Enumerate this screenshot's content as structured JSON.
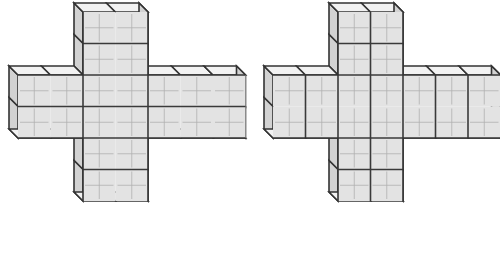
{
  "canvas": {
    "width": 500,
    "height": 262,
    "background": "#ffffff",
    "description": "Two cross (plus) shaped three-dimensional block figures drawn side by side in oblique projection"
  },
  "style": {
    "face_fill": "#e3e3e3",
    "side_fill": "#d2d2d2",
    "bottom_fill": "#f2f2f2",
    "outline_color": "#333333",
    "heavy_line_color": "#3a3a3a",
    "light_line_color": "#b0b0b0",
    "outline_width": 1.6,
    "heavy_line_width": 1.6,
    "light_line_width": 0.8,
    "depth_x": -9,
    "depth_y": -9
  },
  "figures": [
    {
      "id": "left-figure",
      "label": "Left cross figure",
      "origin_x": 18,
      "origin_y": 12,
      "cell_w": 32.5,
      "cell_h": 31.5,
      "arm_cols": 7,
      "arm_rows": 6,
      "center_col_start": 2,
      "center_col_span": 2,
      "center_row_start": 2,
      "center_row_span": 2,
      "horizontal_divisions": 2,
      "vertical_divisions": 6,
      "heavy_rows": [
        1,
        2,
        3,
        4,
        5
      ],
      "heavy_cols": [
        2,
        4
      ],
      "notes": "Horizontal arm split into two rows of cells; vertical arm split into six rows of cells"
    },
    {
      "id": "right-figure",
      "label": "Right cross figure",
      "origin_x": 273,
      "origin_y": 12,
      "cell_w": 32.5,
      "cell_h": 31.5,
      "arm_cols": 7,
      "arm_rows": 6,
      "center_col_start": 2,
      "center_col_span": 2,
      "center_row_start": 2,
      "center_row_span": 2,
      "horizontal_divisions": 1,
      "vertical_divisions": 6,
      "heavy_rows": [
        1,
        2,
        4,
        5
      ],
      "heavy_cols": [
        1,
        2,
        3,
        4,
        5,
        6
      ],
      "notes": "Horizontal arm is one tall row of seven cells; vertical arm split into six rows of two cells"
    }
  ]
}
